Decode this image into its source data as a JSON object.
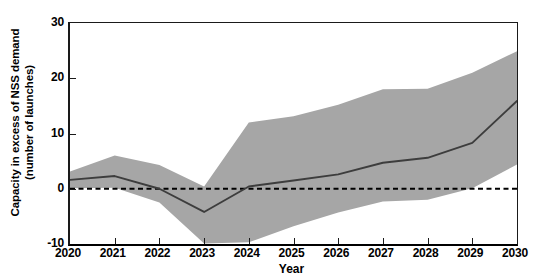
{
  "chart_data": {
    "type": "area",
    "title": "",
    "xlabel": "Year",
    "ylabel_line1": "Capacity in excess of NSS demand",
    "ylabel_line2": "(number of launches)",
    "x": [
      2020,
      2021,
      2022,
      2023,
      2024,
      2025,
      2026,
      2027,
      2028,
      2029,
      2030
    ],
    "categories": [
      "2020",
      "2021",
      "2022",
      "2023",
      "2024",
      "2025",
      "2026",
      "2027",
      "2028",
      "2029",
      "2030"
    ],
    "xlim": [
      2020,
      2030
    ],
    "ylim": [
      -10,
      30
    ],
    "yticks": [
      -10,
      0,
      10,
      20,
      30
    ],
    "ytick_labels": [
      "-10",
      "0",
      "10",
      "20",
      "30"
    ],
    "xticks": [
      2020,
      2021,
      2022,
      2023,
      2024,
      2025,
      2026,
      2027,
      2028,
      2029,
      2030
    ],
    "grid": false,
    "legend": "none",
    "series": [
      {
        "name": "Median capacity in excess of NSS demand",
        "style": "solid-line",
        "color": "#3d3d3d",
        "values": [
          1.6,
          2.3,
          0.0,
          -4.2,
          0.4,
          1.5,
          2.6,
          4.7,
          5.6,
          8.3,
          15.9
        ]
      },
      {
        "name": "Upper bound of uncertainty band",
        "style": "band-upper",
        "color": "#a0a0a0",
        "values": [
          3.1,
          6.0,
          4.3,
          0.4,
          12.0,
          13.1,
          15.2,
          18.0,
          18.1,
          21.0,
          24.9
        ]
      },
      {
        "name": "Lower bound of uncertainty band",
        "style": "band-lower",
        "color": "#a0a0a0",
        "values": [
          0.1,
          0.2,
          -2.5,
          -9.9,
          -9.7,
          -6.8,
          -4.3,
          -2.3,
          -2.0,
          0.1,
          4.4
        ]
      },
      {
        "name": "Zero reference line",
        "style": "dashed-line",
        "color": "#000000",
        "values": [
          0,
          0,
          0,
          0,
          0,
          0,
          0,
          0,
          0,
          0,
          0
        ]
      }
    ],
    "annotations": []
  },
  "colors": {
    "band_fill": "#a6a6a6",
    "median_line": "#3d3d3d",
    "zero_line": "#000000",
    "axis": "#1a1a1a",
    "background": "#ffffff"
  }
}
